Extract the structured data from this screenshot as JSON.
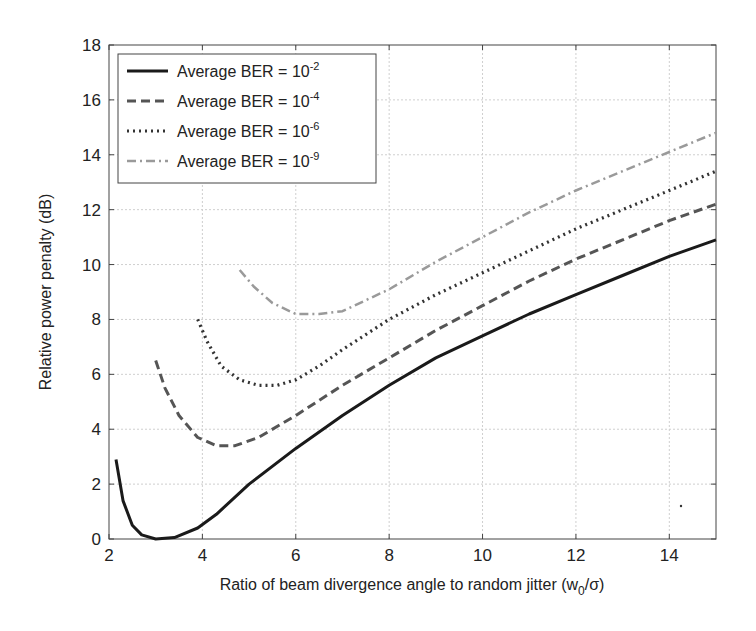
{
  "chart_data": {
    "type": "line",
    "title": "",
    "xlabel": "Ratio of beam divergence angle to random jitter (w_0/σ)",
    "xlabel_main": "Ratio of beam divergence angle to random jitter (w",
    "xlabel_sub": "0",
    "xlabel_tail": "/σ)",
    "ylabel": "Relative power penalty (dB)",
    "xlim": [
      2,
      15
    ],
    "ylim": [
      0,
      18
    ],
    "xticks": [
      2,
      4,
      6,
      8,
      10,
      12,
      14
    ],
    "yticks": [
      0,
      2,
      4,
      6,
      8,
      10,
      12,
      14,
      16,
      18
    ],
    "grid": true,
    "legend_position": "upper left",
    "series": [
      {
        "name": "Average BER = 10^-2",
        "label_base": "Average BER = 10",
        "label_exp": "-2",
        "style": "solid",
        "color": "#1a1a1a",
        "x": [
          2.15,
          2.3,
          2.5,
          2.7,
          3.0,
          3.4,
          3.9,
          4.3,
          5.0,
          6.0,
          7.0,
          8.0,
          9.0,
          10.0,
          11.0,
          12.0,
          13.0,
          14.0,
          15.0
        ],
        "y": [
          2.9,
          1.4,
          0.5,
          0.15,
          0.0,
          0.05,
          0.4,
          0.9,
          2.0,
          3.3,
          4.5,
          5.6,
          6.6,
          7.4,
          8.2,
          8.9,
          9.6,
          10.3,
          10.9
        ]
      },
      {
        "name": "Average BER = 10^-4",
        "label_base": "Average BER = 10",
        "label_exp": "-4",
        "style": "dashed",
        "color": "#555555",
        "x": [
          3.0,
          3.2,
          3.5,
          3.9,
          4.3,
          4.7,
          5.2,
          6.0,
          7.0,
          8.0,
          9.0,
          10.0,
          11.0,
          12.0,
          13.0,
          14.0,
          15.0
        ],
        "y": [
          6.5,
          5.5,
          4.5,
          3.7,
          3.4,
          3.4,
          3.7,
          4.5,
          5.6,
          6.6,
          7.6,
          8.5,
          9.4,
          10.2,
          10.9,
          11.6,
          12.2
        ]
      },
      {
        "name": "Average BER = 10^-6",
        "label_base": "Average BER = 10",
        "label_exp": "-6",
        "style": "dotted",
        "color": "#333333",
        "x": [
          3.9,
          4.1,
          4.4,
          4.8,
          5.2,
          5.6,
          6.0,
          6.5,
          7.0,
          8.0,
          9.0,
          10.0,
          11.0,
          12.0,
          13.0,
          14.0,
          15.0
        ],
        "y": [
          8.0,
          7.2,
          6.3,
          5.8,
          5.6,
          5.6,
          5.8,
          6.3,
          6.9,
          8.0,
          8.9,
          9.7,
          10.5,
          11.3,
          12.0,
          12.7,
          13.4
        ]
      },
      {
        "name": "Average BER = 10^-9",
        "label_base": "Average BER = 10",
        "label_exp": "-9",
        "style": "dashdot",
        "color": "#9a9a9a",
        "x": [
          4.8,
          5.1,
          5.5,
          6.0,
          6.5,
          7.0,
          7.5,
          8.0,
          9.0,
          10.0,
          11.0,
          12.0,
          13.0,
          14.0,
          15.0
        ],
        "y": [
          9.8,
          9.2,
          8.6,
          8.2,
          8.2,
          8.3,
          8.7,
          9.1,
          10.1,
          11.0,
          11.9,
          12.7,
          13.4,
          14.1,
          14.8
        ]
      }
    ]
  }
}
